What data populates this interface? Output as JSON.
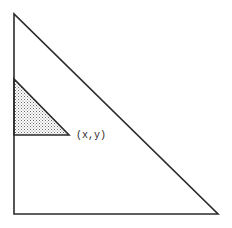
{
  "diagram": {
    "type": "geometry",
    "outer_triangle": {
      "vertices": [
        [
          14,
          14
        ],
        [
          14,
          214
        ],
        [
          218,
          214
        ]
      ],
      "stroke": "#2b2b2b",
      "fill": "none"
    },
    "shaded_triangle": {
      "vertices": [
        [
          14,
          79
        ],
        [
          14,
          135
        ],
        [
          69,
          135
        ]
      ],
      "stroke": "#2b2b2b",
      "fill_pattern": "stipple",
      "fill_color": "#cfcfcf"
    },
    "point_label": "(x,y)"
  }
}
